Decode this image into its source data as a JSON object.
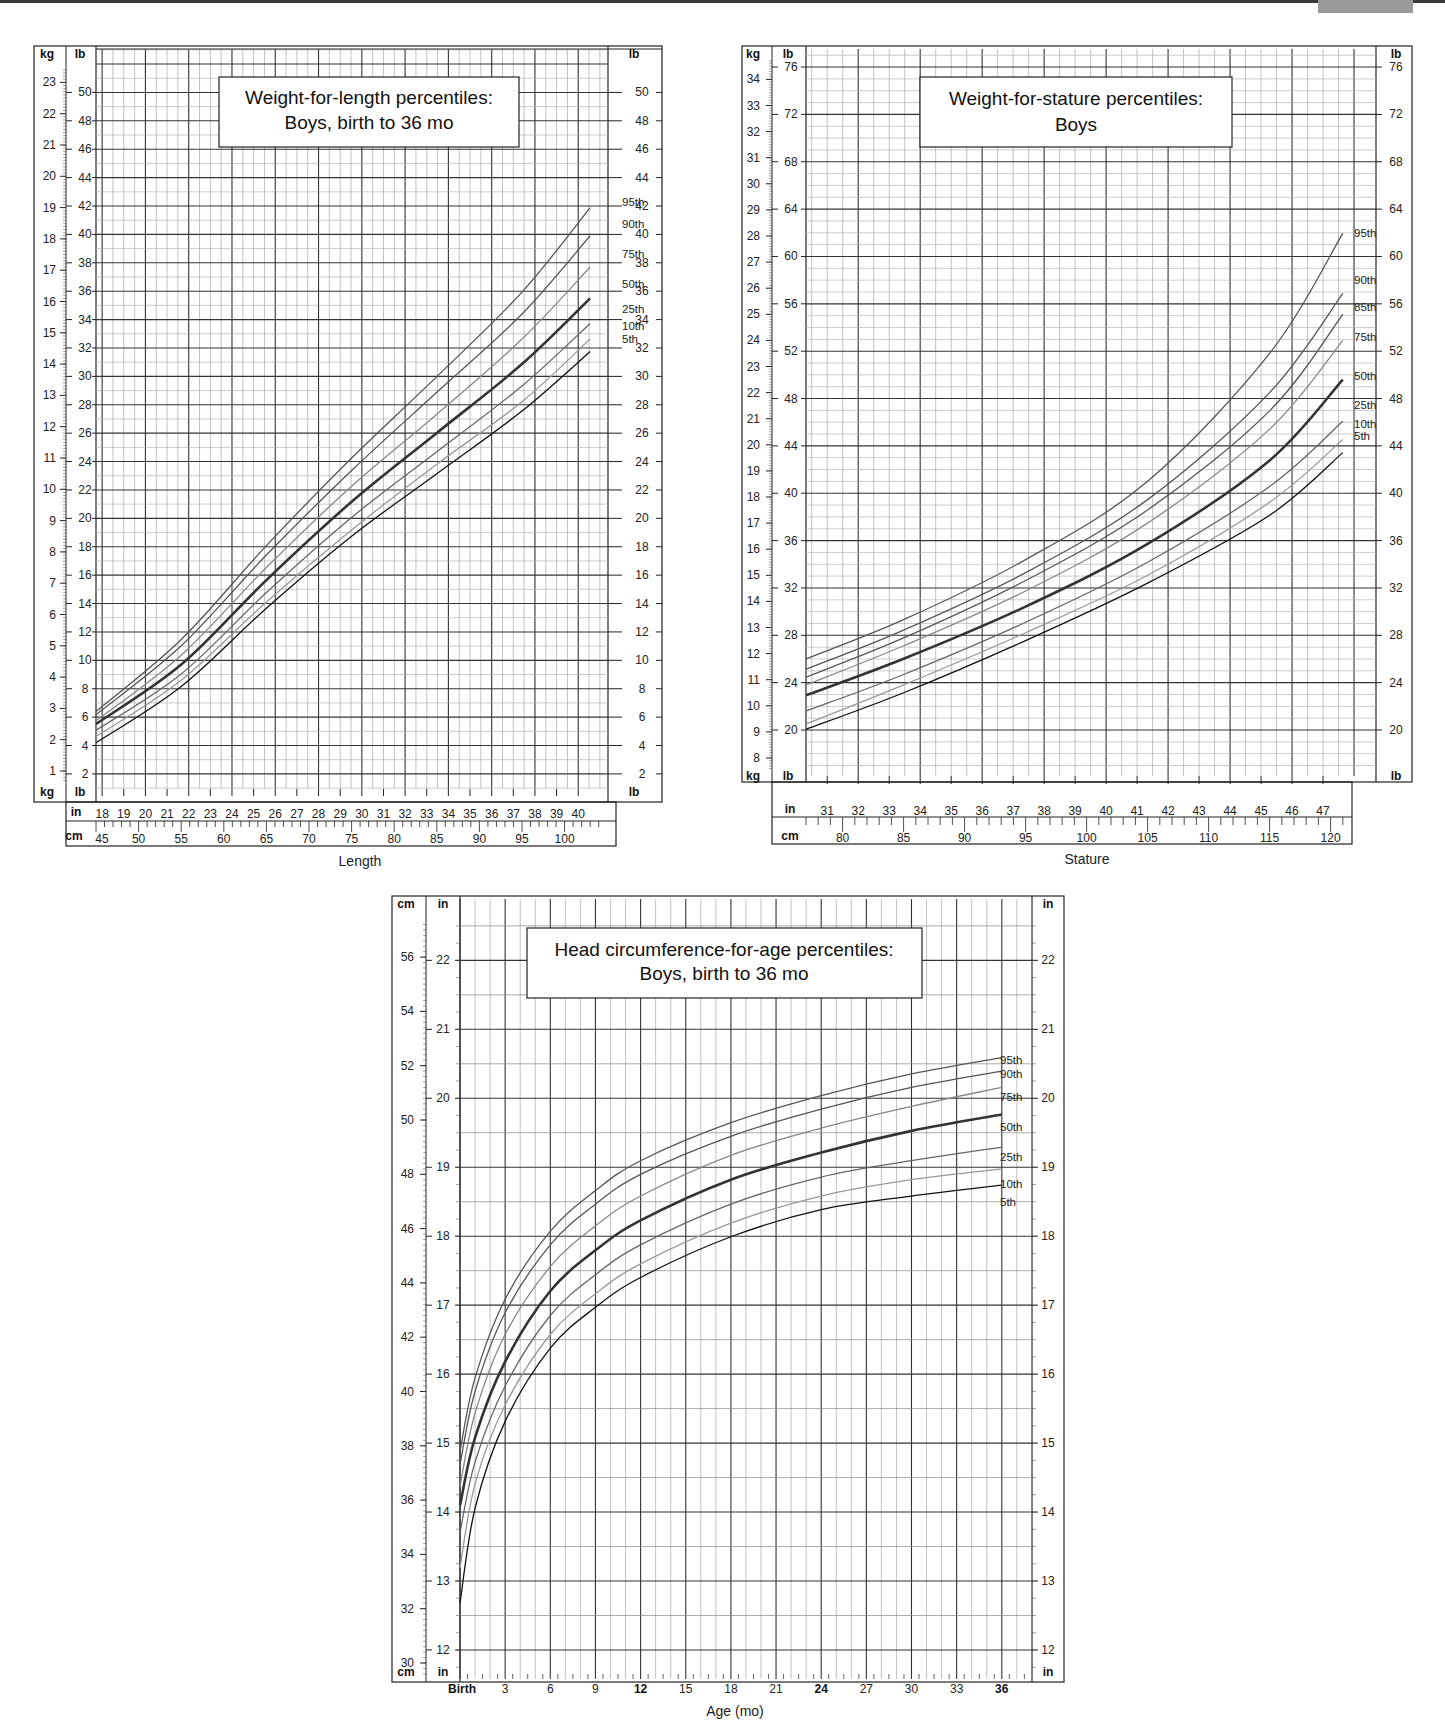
{
  "page": {
    "header_tab_color": "#9a9a9a"
  },
  "chart_data": [
    {
      "id": "wfl",
      "type": "line",
      "title": "Weight-for-length percentiles:\nBoys, birth to 36 mo",
      "title_lines": [
        "Weight-for-length percentiles:",
        "Boys, birth to 36 mo"
      ],
      "xlabel": "Length",
      "x_unit_primary": "cm",
      "x_unit_secondary": "in",
      "ylabel_left": "kg",
      "ylabel_inner": "lb",
      "ylabel_right": "lb",
      "xlim_cm": [
        45,
        105
      ],
      "ylim_kg": [
        0.5,
        24
      ],
      "grid": true,
      "kg_ticks": [
        1,
        2,
        3,
        4,
        5,
        6,
        7,
        8,
        9,
        10,
        11,
        12,
        13,
        14,
        15,
        16,
        17,
        18,
        19,
        20,
        21,
        22,
        23
      ],
      "lb_ticks": [
        2,
        4,
        6,
        8,
        10,
        12,
        14,
        16,
        18,
        20,
        22,
        24,
        26,
        28,
        30,
        32,
        34,
        36,
        38,
        40,
        42,
        44,
        46,
        48,
        50
      ],
      "in_ticks": [
        18,
        19,
        20,
        21,
        22,
        23,
        24,
        25,
        26,
        27,
        28,
        29,
        30,
        31,
        32,
        33,
        34,
        35,
        36,
        37,
        38,
        39,
        40
      ],
      "cm_ticks": [
        45,
        50,
        55,
        60,
        65,
        70,
        75,
        80,
        85,
        90,
        95,
        100
      ],
      "legend": [
        "95th",
        "90th",
        "75th",
        "50th",
        "25th",
        "10th",
        "5th"
      ],
      "x": [
        45,
        55,
        65,
        75,
        85,
        95,
        103
      ],
      "series": [
        {
          "name": "95th",
          "values": [
            2.9,
            5.2,
            8.2,
            11.0,
            13.6,
            16.3,
            19.0
          ]
        },
        {
          "name": "90th",
          "values": [
            2.8,
            5.0,
            7.9,
            10.6,
            13.1,
            15.6,
            18.1
          ]
        },
        {
          "name": "75th",
          "values": [
            2.6,
            4.7,
            7.5,
            10.1,
            12.4,
            14.8,
            17.1
          ]
        },
        {
          "name": "50th",
          "values": [
            2.5,
            4.4,
            7.1,
            9.6,
            11.8,
            14.0,
            16.1
          ]
        },
        {
          "name": "25th",
          "values": [
            2.3,
            4.1,
            6.7,
            9.1,
            11.2,
            13.3,
            15.3
          ]
        },
        {
          "name": "10th",
          "values": [
            2.1,
            3.9,
            6.4,
            8.7,
            10.8,
            12.8,
            14.8
          ]
        },
        {
          "name": "5th",
          "values": [
            1.9,
            3.7,
            6.2,
            8.5,
            10.5,
            12.5,
            14.4
          ]
        }
      ]
    },
    {
      "id": "wfs",
      "type": "line",
      "title": "Weight-for-stature percentiles:\nBoys",
      "title_lines": [
        "Weight-for-stature percentiles:",
        "Boys"
      ],
      "xlabel": "Stature",
      "x_unit_primary": "cm",
      "x_unit_secondary": "in",
      "ylabel_left": "kg",
      "ylabel_inner": "lb",
      "ylabel_right": "lb",
      "xlim_cm": [
        77,
        122
      ],
      "ylim_kg": [
        7.5,
        35
      ],
      "grid": true,
      "kg_ticks": [
        8,
        9,
        10,
        11,
        12,
        13,
        14,
        15,
        16,
        17,
        18,
        19,
        20,
        21,
        22,
        23,
        24,
        25,
        26,
        27,
        28,
        29,
        30,
        31,
        32,
        33,
        34
      ],
      "lb_ticks": [
        20,
        24,
        28,
        32,
        36,
        40,
        44,
        48,
        52,
        56,
        60,
        64,
        68,
        72,
        76
      ],
      "in_ticks": [
        31,
        32,
        33,
        34,
        35,
        36,
        37,
        38,
        39,
        40,
        41,
        42,
        43,
        44,
        45,
        46,
        47
      ],
      "cm_ticks": [
        80,
        85,
        90,
        95,
        100,
        105,
        110,
        115,
        120
      ],
      "legend": [
        "95th",
        "90th",
        "85th",
        "75th",
        "50th",
        "25th",
        "10th",
        "5th"
      ],
      "x": [
        77,
        85,
        95,
        105,
        115,
        121
      ],
      "series": [
        {
          "name": "95th",
          "values": [
            11.8,
            13.3,
            15.6,
            18.6,
            23.5,
            28.1
          ]
        },
        {
          "name": "90th",
          "values": [
            11.4,
            12.9,
            15.1,
            17.9,
            22.0,
            25.8
          ]
        },
        {
          "name": "85th",
          "values": [
            11.1,
            12.6,
            14.8,
            17.5,
            21.3,
            25.0
          ]
        },
        {
          "name": "75th",
          "values": [
            10.8,
            12.3,
            14.4,
            17.0,
            20.6,
            24.0
          ]
        },
        {
          "name": "50th",
          "values": [
            10.4,
            11.8,
            13.8,
            16.2,
            19.4,
            22.5
          ]
        },
        {
          "name": "25th",
          "values": [
            9.8,
            11.2,
            13.2,
            15.5,
            18.4,
            20.9
          ]
        },
        {
          "name": "10th",
          "values": [
            9.3,
            10.8,
            12.8,
            15.0,
            17.8,
            20.2
          ]
        },
        {
          "name": "5th",
          "values": [
            9.1,
            10.5,
            12.5,
            14.7,
            17.3,
            19.7
          ]
        }
      ]
    },
    {
      "id": "hc",
      "type": "line",
      "title": "Head circumference-for-age percentiles:\nBoys, birth to 36 mo",
      "title_lines": [
        "Head circumference-for-age percentiles:",
        "Boys, birth to 36 mo"
      ],
      "xlabel": "Age (mo)",
      "ylabel_left": "cm",
      "ylabel_inner": "in",
      "ylabel_right": "in",
      "xlim_mo": [
        0,
        38
      ],
      "ylim_cm": [
        29.5,
        57.5
      ],
      "grid": true,
      "cm_ticks": [
        30,
        32,
        34,
        36,
        38,
        40,
        42,
        44,
        46,
        48,
        50,
        52,
        54,
        56
      ],
      "in_ticks": [
        12,
        13,
        14,
        15,
        16,
        17,
        18,
        19,
        20,
        21,
        22
      ],
      "x_tick_labels": [
        "Birth",
        "3",
        "6",
        "9",
        "12",
        "15",
        "18",
        "21",
        "24",
        "27",
        "30",
        "33",
        "36"
      ],
      "x_bold_ticks": [
        "Birth",
        "12",
        "24",
        "36"
      ],
      "legend": [
        "95th",
        "90th",
        "75th",
        "50th",
        "25th",
        "10th",
        "5th"
      ],
      "x": [
        0,
        1,
        3,
        6,
        9,
        12,
        18,
        24,
        30,
        36
      ],
      "series": [
        {
          "name": "95th",
          "values": [
            37.8,
            40.5,
            43.4,
            45.9,
            47.4,
            48.5,
            49.9,
            50.9,
            51.7,
            52.3
          ]
        },
        {
          "name": "90th",
          "values": [
            37.3,
            40.0,
            42.9,
            45.4,
            46.9,
            48.0,
            49.4,
            50.4,
            51.2,
            51.8
          ]
        },
        {
          "name": "75th",
          "values": [
            36.5,
            39.2,
            42.1,
            44.6,
            46.1,
            47.2,
            48.7,
            49.7,
            50.5,
            51.2
          ]
        },
        {
          "name": "50th",
          "values": [
            35.8,
            38.3,
            41.1,
            43.7,
            45.2,
            46.3,
            47.8,
            48.8,
            49.6,
            50.2
          ]
        },
        {
          "name": "25th",
          "values": [
            34.8,
            37.4,
            40.2,
            42.8,
            44.3,
            45.4,
            46.9,
            47.9,
            48.5,
            49.0
          ]
        },
        {
          "name": "10th",
          "values": [
            33.5,
            36.6,
            39.5,
            42.1,
            43.6,
            44.7,
            46.2,
            47.2,
            47.8,
            48.2
          ]
        },
        {
          "name": "5th",
          "values": [
            32.2,
            35.7,
            38.9,
            41.6,
            43.1,
            44.2,
            45.7,
            46.7,
            47.2,
            47.6
          ]
        }
      ]
    }
  ]
}
